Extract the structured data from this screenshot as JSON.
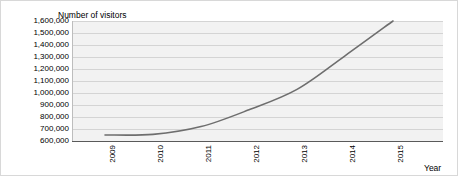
{
  "chart_data": {
    "type": "line",
    "title": "",
    "ylabel": "Number of visitors",
    "xlabel": "Year",
    "categories": [
      "2009",
      "2010",
      "2011",
      "2012",
      "2013",
      "2014",
      "2015"
    ],
    "x": [
      2009,
      2010,
      2011,
      2012,
      2013,
      2014,
      2015
    ],
    "series": [
      {
        "name": "Number of visitors",
        "values": [
          650000,
          655000,
          720000,
          860000,
          1030000,
          1310000,
          1600000
        ],
        "color": "#6e6e6e"
      }
    ],
    "ylim": [
      600000,
      1600000
    ],
    "ytick_labels": [
      "1,600,000",
      "1,500,000",
      "1,400,000",
      "1,300,000",
      "1,200,000",
      "1,100,000",
      "1,000,000",
      "900,000",
      "800,000",
      "700,000",
      "600,000"
    ],
    "ytick_values": [
      1600000,
      1500000,
      1400000,
      1300000,
      1200000,
      1100000,
      1000000,
      900000,
      800000,
      700000,
      600000
    ],
    "grid": true,
    "legend": "none",
    "plot_background": "#f2f2f2",
    "gridline_color": "#d4d4d4",
    "axis_color": "#5a5a5a"
  }
}
